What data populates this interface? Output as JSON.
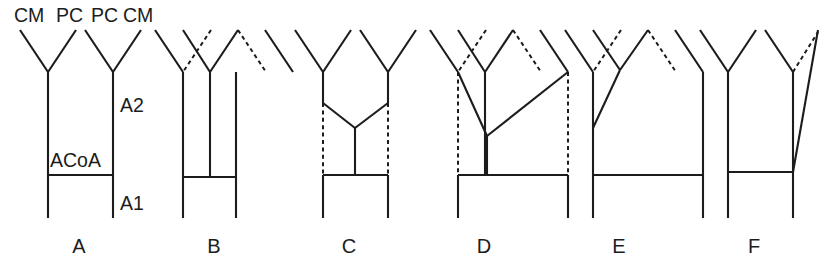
{
  "figure": {
    "background_color": "#ffffff",
    "line_color": "#1c1c1c",
    "panel_count": 6
  },
  "top_labels": [
    {
      "text": "CM",
      "x": 14,
      "y": 22
    },
    {
      "text": "PC",
      "x": 56,
      "y": 22
    },
    {
      "text": "PC",
      "x": 91,
      "y": 22
    },
    {
      "text": "CM",
      "x": 123,
      "y": 22
    }
  ],
  "side_labels": [
    {
      "text": "A2",
      "x": 120,
      "y": 112
    },
    {
      "text": "ACoA",
      "x": 50,
      "y": 167
    },
    {
      "text": "A1",
      "x": 120,
      "y": 210
    }
  ],
  "panel_letters": [
    {
      "text": "A",
      "x": 79,
      "y": 253
    },
    {
      "text": "B",
      "x": 214,
      "y": 253
    },
    {
      "text": "C",
      "x": 349,
      "y": 253
    },
    {
      "text": "D",
      "x": 484,
      "y": 253
    },
    {
      "text": "E",
      "x": 619,
      "y": 253
    },
    {
      "text": "F",
      "x": 754,
      "y": 253
    }
  ],
  "panels": [
    {
      "id": "A",
      "name": "panel-a-normal",
      "solid": [
        [
          20,
          30,
          48,
          72
        ],
        [
          76,
          30,
          48,
          72
        ],
        [
          85,
          30,
          113,
          72
        ],
        [
          141,
          30,
          113,
          72
        ],
        [
          48,
          72,
          48,
          218
        ],
        [
          113,
          72,
          113,
          218
        ],
        [
          48,
          175,
          113,
          175
        ]
      ],
      "dashed": []
    },
    {
      "id": "B",
      "name": "panel-b-triple-a2",
      "solid": [
        [
          155,
          30,
          183,
          72
        ],
        [
          183,
          30,
          210,
          72
        ],
        [
          238,
          30,
          210,
          72
        ],
        [
          265,
          30,
          293,
          72
        ],
        [
          183,
          72,
          183,
          218
        ],
        [
          210,
          72,
          210,
          177
        ],
        [
          236,
          72,
          236,
          218
        ],
        [
          183,
          177,
          236,
          177
        ]
      ],
      "dashed": [
        [
          211,
          30,
          183,
          72
        ],
        [
          238,
          30,
          266,
          72
        ]
      ]
    },
    {
      "id": "C",
      "name": "panel-c-azygos",
      "solid": [
        [
          295,
          30,
          323,
          72
        ],
        [
          351,
          30,
          323,
          72
        ],
        [
          360,
          30,
          388,
          72
        ],
        [
          416,
          30,
          388,
          72
        ],
        [
          323,
          72,
          323,
          103
        ],
        [
          388,
          72,
          388,
          103
        ],
        [
          323,
          103,
          355,
          128
        ],
        [
          388,
          103,
          355,
          128
        ],
        [
          355,
          128,
          355,
          175
        ],
        [
          323,
          175,
          388,
          175
        ],
        [
          323,
          175,
          323,
          218
        ],
        [
          388,
          175,
          388,
          218
        ]
      ],
      "dashed": [
        [
          323,
          103,
          323,
          175
        ],
        [
          388,
          103,
          388,
          175
        ]
      ]
    },
    {
      "id": "D",
      "name": "panel-d-triple-converging",
      "solid": [
        [
          430,
          30,
          458,
          72
        ],
        [
          458,
          30,
          485,
          72
        ],
        [
          513,
          30,
          485,
          72
        ],
        [
          540,
          30,
          568,
          72
        ],
        [
          458,
          72,
          487,
          136
        ],
        [
          568,
          72,
          487,
          136
        ],
        [
          485,
          72,
          485,
          175
        ],
        [
          487,
          136,
          487,
          175
        ],
        [
          458,
          175,
          568,
          175
        ],
        [
          458,
          175,
          458,
          218
        ],
        [
          568,
          175,
          568,
          218
        ]
      ],
      "dashed": [
        [
          486,
          30,
          458,
          72
        ],
        [
          513,
          30,
          541,
          72
        ],
        [
          458,
          72,
          458,
          175
        ],
        [
          568,
          72,
          568,
          175
        ]
      ]
    },
    {
      "id": "E",
      "name": "panel-e-diagonal-branch",
      "solid": [
        [
          565,
          30,
          593,
          72
        ],
        [
          593,
          30,
          620,
          70
        ],
        [
          648,
          30,
          620,
          70
        ],
        [
          675,
          30,
          703,
          72
        ],
        [
          620,
          70,
          593,
          128
        ],
        [
          593,
          72,
          593,
          218
        ],
        [
          703,
          72,
          703,
          218
        ],
        [
          593,
          175,
          703,
          175
        ]
      ],
      "dashed": [
        [
          621,
          30,
          593,
          72
        ],
        [
          648,
          30,
          676,
          72
        ]
      ]
    },
    {
      "id": "F",
      "name": "panel-f-long-diagonal",
      "solid": [
        [
          700,
          30,
          728,
          72
        ],
        [
          756,
          30,
          728,
          72
        ],
        [
          765,
          30,
          793,
          72
        ],
        [
          728,
          72,
          728,
          218
        ],
        [
          793,
          72,
          793,
          218
        ],
        [
          793,
          172,
          818,
          30
        ],
        [
          728,
          172,
          793,
          172
        ]
      ],
      "dashed": [
        [
          793,
          72,
          818,
          32
        ]
      ]
    }
  ]
}
